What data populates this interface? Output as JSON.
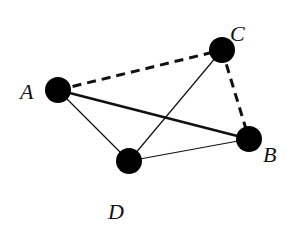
{
  "diagram": {
    "type": "graph",
    "nodes": [
      {
        "id": "A",
        "label": "A",
        "x": 58,
        "y": 90,
        "label_x": 20,
        "label_y": 99
      },
      {
        "id": "C",
        "label": "C",
        "x": 222,
        "y": 50,
        "label_x": 230,
        "label_y": 41
      },
      {
        "id": "B",
        "label": "B",
        "x": 249,
        "y": 139,
        "label_x": 263,
        "label_y": 162
      },
      {
        "id": "D",
        "label": "D",
        "x": 129,
        "y": 161,
        "label_x": 108,
        "label_y": 219
      }
    ],
    "edges": [
      {
        "from": "A",
        "to": "C",
        "style": "dashed-thick"
      },
      {
        "from": "C",
        "to": "B",
        "style": "dashed-thick"
      },
      {
        "from": "A",
        "to": "B",
        "style": "solid-thick"
      },
      {
        "from": "A",
        "to": "D",
        "style": "solid-thin"
      },
      {
        "from": "D",
        "to": "C",
        "style": "solid-thin"
      },
      {
        "from": "D",
        "to": "B",
        "style": "solid-thin"
      }
    ],
    "colors": {
      "node": "#000000",
      "edge": "#111111",
      "background": "#ffffff"
    }
  }
}
